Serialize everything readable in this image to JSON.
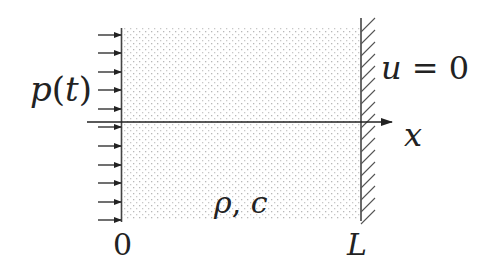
{
  "diagram": {
    "colors": {
      "ink": "#222222",
      "dots": "#b8b8b8",
      "background": "#ffffff"
    },
    "labels": {
      "load": "p(t)",
      "boundary_condition": "u = 0",
      "axis": "x",
      "material": "ρ, c",
      "origin": "0",
      "length": "L"
    },
    "load_arrows": {
      "count": 11,
      "direction": "right",
      "y_positions": [
        35,
        53,
        72,
        90,
        109,
        127,
        146,
        165,
        183,
        202,
        220
      ]
    },
    "domain": {
      "x_start": 122,
      "x_end": 360,
      "y_top": 28,
      "y_bottom": 219,
      "fill": "dotted"
    },
    "wall": {
      "x": 361,
      "y_top": 18,
      "y_bottom": 221,
      "hatch": "diagonal"
    },
    "axis": {
      "y": 122,
      "x_start": 87,
      "x_end": 392
    }
  }
}
